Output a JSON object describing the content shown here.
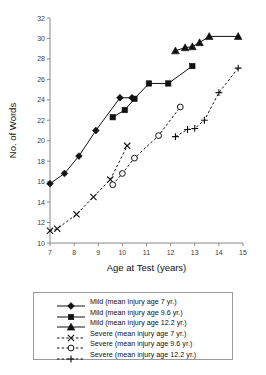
{
  "chart_data": {
    "type": "line",
    "title": "",
    "xlabel": "Age at Test (years)",
    "ylabel": "No. of Words",
    "xlim": [
      7,
      15
    ],
    "ylim": [
      10,
      32
    ],
    "xticks": [
      7,
      8,
      9,
      10,
      11,
      12,
      13,
      14,
      15
    ],
    "yticks": [
      10,
      12,
      14,
      16,
      18,
      20,
      22,
      24,
      26,
      28,
      30,
      32
    ],
    "grid": false,
    "legend_position": "below-plot",
    "series": [
      {
        "name": "Mild (mean injury age 7 yr.)",
        "marker": "filled-diamond",
        "line": "solid",
        "x": [
          7.0,
          7.6,
          8.2,
          8.9,
          9.9,
          10.4
        ],
        "y": [
          15.8,
          16.8,
          18.5,
          21.0,
          24.2,
          24.2
        ]
      },
      {
        "name": "Mild (mean injury age 9.6 yr.)",
        "marker": "filled-square",
        "line": "solid",
        "x": [
          9.6,
          10.1,
          10.5,
          11.1,
          11.9,
          12.9
        ],
        "y": [
          22.3,
          23.0,
          24.1,
          25.6,
          25.6,
          27.3
        ]
      },
      {
        "name": "Mild (mean injury age 12.2 yr.)",
        "marker": "filled-triangle",
        "line": "solid",
        "x": [
          12.2,
          12.6,
          12.9,
          13.2,
          13.6,
          14.8
        ],
        "y": [
          28.8,
          29.1,
          29.2,
          29.6,
          30.2,
          30.2
        ]
      },
      {
        "name": "Severe (mean injury age 7 yr.)",
        "marker": "cross-x",
        "line": "dashed",
        "x": [
          7.0,
          7.3,
          8.1,
          8.8,
          9.5,
          10.2
        ],
        "y": [
          11.2,
          11.4,
          12.8,
          14.5,
          16.2,
          19.5
        ]
      },
      {
        "name": "Severe (mean injury age 9.6 yr.)",
        "marker": "open-circle",
        "line": "dashed",
        "x": [
          9.6,
          10.0,
          10.5,
          11.5,
          12.4
        ],
        "y": [
          15.7,
          16.8,
          18.3,
          20.5,
          23.3
        ]
      },
      {
        "name": "Severe (mean injury age 12.2 yr.)",
        "marker": "plus",
        "line": "dashed",
        "x": [
          12.2,
          12.7,
          13.0,
          13.4,
          14.0,
          14.8
        ],
        "y": [
          20.4,
          21.1,
          21.2,
          22.0,
          24.7,
          27.1
        ]
      }
    ]
  },
  "legend": {
    "entries": [
      {
        "label": "Mild (mean injury age 7 yr.)",
        "marker": "filled-diamond",
        "line": "solid"
      },
      {
        "label": "Mild (mean injury age 9.6 yr.)",
        "marker": "filled-square",
        "line": "solid"
      },
      {
        "label": "Mild (mean injury age 12.2 yr.)",
        "marker": "filled-triangle",
        "line": "solid"
      },
      {
        "label": "Severe (mean injury age 7 yr.)",
        "marker": "cross-x",
        "line": "dashed"
      },
      {
        "label": "Severe (mean injury age 9.6 yr.)",
        "marker": "open-circle",
        "line": "dashed"
      },
      {
        "label": "Severe (mean injury age 12.2 yr.)",
        "marker": "plus",
        "line": "dashed"
      }
    ]
  },
  "colors": {
    "ink": "#111111",
    "axis": "#8a8a8a",
    "background": "#ffffff"
  }
}
